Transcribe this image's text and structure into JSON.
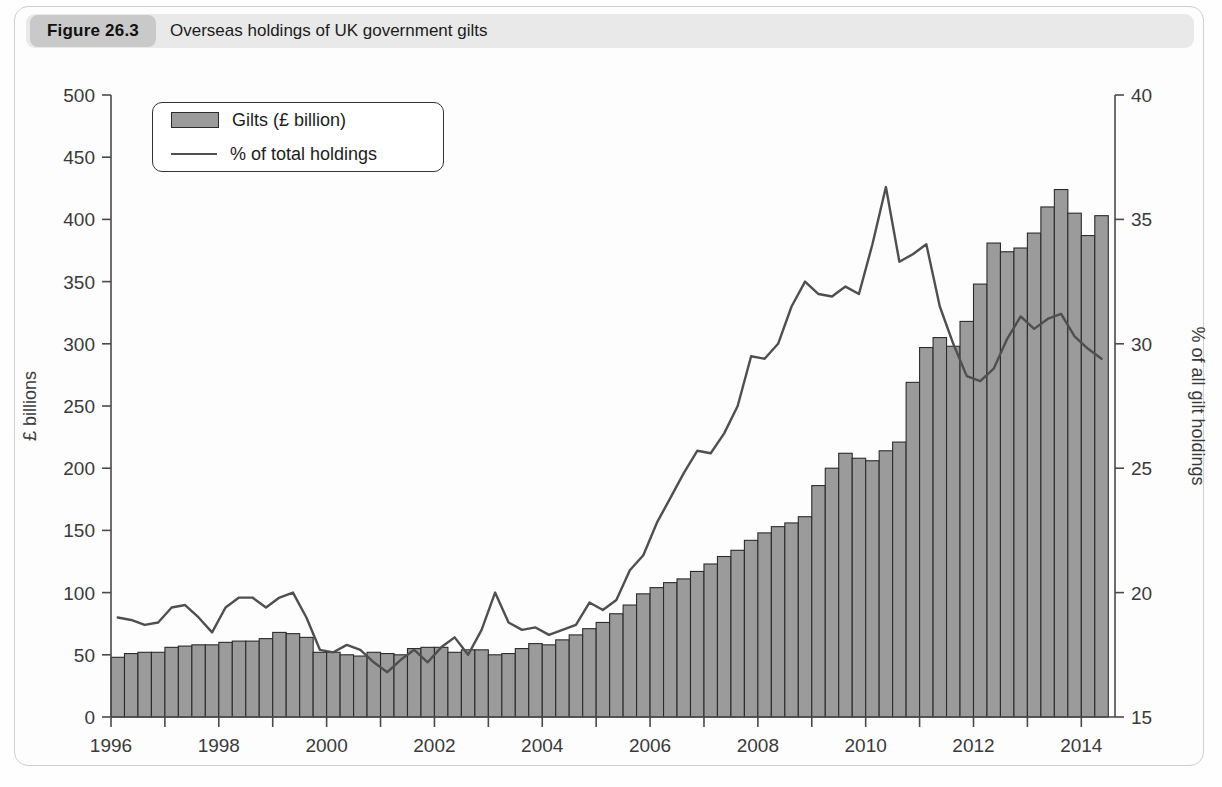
{
  "figure": {
    "tag": "Figure 26.3",
    "title": "Overseas holdings of UK government gilts"
  },
  "legend": {
    "items": [
      {
        "label": "Gilts (£ billion)",
        "marker": "bar-swatch",
        "color": "#9b9b9b"
      },
      {
        "label": "% of total holdings",
        "marker": "line-swatch",
        "color": "#4f4f4f"
      }
    ]
  },
  "chart_data": {
    "type": "bar",
    "title": "Overseas holdings of UK government gilts",
    "xlabel": "",
    "ylabel": "£ billions",
    "y2label": "% of all gilt holdings",
    "ylim": [
      0,
      500
    ],
    "y2lim": [
      15,
      40
    ],
    "grid": false,
    "legend_position": "top-left",
    "x_tick_labels": [
      "1996",
      "1998",
      "2000",
      "2002",
      "2004",
      "2006",
      "2008",
      "2010",
      "2012",
      "2014"
    ],
    "x_tick_values": [
      1996,
      1998,
      2000,
      2002,
      2004,
      2006,
      2008,
      2010,
      2012,
      2014
    ],
    "y_tick_labels": [
      "0",
      "50",
      "100",
      "150",
      "200",
      "250",
      "300",
      "350",
      "400",
      "450",
      "500"
    ],
    "y_tick_values": [
      0,
      50,
      100,
      150,
      200,
      250,
      300,
      350,
      400,
      450,
      500
    ],
    "y2_tick_labels": [
      "15",
      "20",
      "25",
      "30",
      "35",
      "40"
    ],
    "y2_tick_values": [
      15,
      20,
      25,
      30,
      35,
      40
    ],
    "x_period": "quarterly",
    "x": [
      1996.0,
      1996.25,
      1996.5,
      1996.75,
      1997.0,
      1997.25,
      1997.5,
      1997.75,
      1998.0,
      1998.25,
      1998.5,
      1998.75,
      1999.0,
      1999.25,
      1999.5,
      1999.75,
      2000.0,
      2000.25,
      2000.5,
      2000.75,
      2001.0,
      2001.25,
      2001.5,
      2001.75,
      2002.0,
      2002.25,
      2002.5,
      2002.75,
      2003.0,
      2003.25,
      2003.5,
      2003.75,
      2004.0,
      2004.25,
      2004.5,
      2004.75,
      2005.0,
      2005.25,
      2005.5,
      2005.75,
      2006.0,
      2006.25,
      2006.5,
      2006.75,
      2007.0,
      2007.25,
      2007.5,
      2007.75,
      2008.0,
      2008.25,
      2008.5,
      2008.75,
      2009.0,
      2009.25,
      2009.5,
      2009.75,
      2010.0,
      2010.25,
      2010.5,
      2010.75,
      2011.0,
      2011.25,
      2011.5,
      2011.75,
      2012.0,
      2012.25,
      2012.5,
      2012.75,
      2013.0,
      2013.25,
      2013.5,
      2013.75,
      2014.0,
      2014.25
    ],
    "series": [
      {
        "name": "Gilts (£ billion)",
        "axis": "left",
        "type": "bar",
        "color": "#9b9b9b",
        "values": [
          48,
          51,
          52,
          52,
          56,
          57,
          58,
          58,
          60,
          61,
          61,
          63,
          68,
          67,
          64,
          52,
          52,
          50,
          49,
          52,
          51,
          50,
          55,
          56,
          56,
          52,
          54,
          54,
          50,
          51,
          55,
          59,
          58,
          62,
          66,
          71,
          76,
          83,
          90,
          99,
          104,
          108,
          111,
          117,
          123,
          129,
          134,
          142,
          148,
          153,
          156,
          161,
          186,
          200,
          212,
          208,
          206,
          214,
          221,
          269,
          297,
          305,
          298,
          318,
          348,
          381,
          374,
          377,
          389,
          410,
          424,
          405,
          387,
          403
        ]
      },
      {
        "name": "% of total holdings",
        "axis": "right",
        "type": "line",
        "color": "#4f4f4f",
        "values": [
          19.0,
          18.9,
          18.7,
          18.8,
          19.4,
          19.5,
          19.0,
          18.4,
          19.4,
          19.8,
          19.8,
          19.4,
          19.8,
          20.0,
          19.0,
          17.7,
          17.6,
          17.9,
          17.7,
          17.2,
          16.8,
          17.3,
          17.7,
          17.2,
          17.8,
          18.2,
          17.5,
          18.5,
          20.0,
          18.8,
          18.5,
          18.6,
          18.3,
          18.5,
          18.7,
          19.6,
          19.3,
          19.7,
          20.9,
          21.5,
          22.8,
          23.8,
          24.8,
          25.7,
          25.6,
          26.4,
          27.5,
          29.5,
          29.4,
          30.0,
          31.5,
          32.5,
          32.0,
          31.9,
          32.3,
          32.0,
          34.0,
          36.3,
          33.3,
          33.6,
          34.0,
          31.5,
          30.0,
          28.7,
          28.5,
          29.0,
          30.2,
          31.1,
          30.6,
          31.0,
          31.2,
          30.3,
          29.8,
          29.4
        ],
        "peak": {
          "value": 36.3,
          "x": 2009.0,
          "note": "peak of overseas share"
        },
        "trough": {
          "value": 16.8,
          "x": 2001.0,
          "note": "low point of overseas share"
        }
      }
    ]
  }
}
